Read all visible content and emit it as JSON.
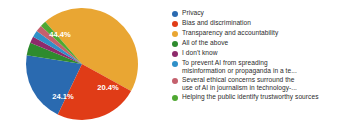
{
  "chart_data": {
    "type": "pie",
    "title": "",
    "legend_position": "right",
    "categories": [
      "Privacy",
      "Bias and discrimination",
      "Transparency and accountability",
      "All of the above",
      "I don't know",
      "To prevent AI from spreading misinformation or propaganda in a te...",
      "Several ethical concerns surround the use of AI in journalism in technology-...",
      "Helping the public identify trustworthy sources"
    ],
    "values": [
      20.4,
      24.1,
      44.4,
      3.7,
      1.9,
      1.9,
      1.9,
      1.7
    ],
    "colors": [
      "#2a6ab0",
      "#e03c17",
      "#e9a633",
      "#2e8b2e",
      "#8e2a6b",
      "#2f90c8",
      "#c4606d",
      "#4fa832"
    ],
    "visible_labels": [
      "20.4%",
      "24.1%",
      "44.4%"
    ],
    "xlabel": "",
    "ylabel": ""
  },
  "legend": {
    "items": [
      {
        "label": "Privacy",
        "color": "#2a6ab0"
      },
      {
        "label": "Bias and discrimination",
        "color": "#e03c17"
      },
      {
        "label": "Transparency and accountability",
        "color": "#e9a633"
      },
      {
        "label": "All of the above",
        "color": "#2e8b2e"
      },
      {
        "label": "I don't know",
        "color": "#8e2a6b"
      },
      {
        "label": "To prevent AI from spreading\nmisinformation or propaganda in a te...",
        "color": "#2f90c8"
      },
      {
        "label": "Several ethical concerns surround the\nuse of AI in journalism in technology-...",
        "color": "#c4606d"
      },
      {
        "label": "Helping the public identify trustworthy sources",
        "color": "#4fa832"
      }
    ]
  },
  "pie": {
    "label_amber": "44.4%",
    "label_blue": "20.4%",
    "label_orange": "24.1%"
  }
}
